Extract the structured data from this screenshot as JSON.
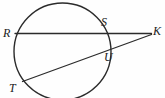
{
  "figure": {
    "kind": "geometry-diagram",
    "width": 165,
    "height": 98,
    "background_color": "#fefefe",
    "stroke_color": "#2b2b2b",
    "label_color": "#1b1b1b",
    "circle": {
      "name": "main-circle",
      "cx": 62.5,
      "cy": 51.5,
      "r": 48.5,
      "stroke_width": 1.4,
      "fill": "none"
    },
    "segments": [
      {
        "name": "secant-rk",
        "from": "R",
        "to": "K",
        "x1": 15,
        "y1": 33.5,
        "x2": 151.5,
        "y2": 33.5,
        "stroke_width": 1.3
      },
      {
        "name": "secant-tk",
        "from": "T",
        "to": "K",
        "x1": 22.5,
        "y1": 81.5,
        "x2": 151.5,
        "y2": 34.5,
        "stroke_width": 1.3
      }
    ],
    "points": [
      {
        "id": "R",
        "label": "R",
        "x": 15,
        "y": 33.5,
        "label_x": 3,
        "label_y": 27
      },
      {
        "id": "S",
        "label": "S",
        "x": 101,
        "y": 33.5,
        "label_x": 101,
        "label_y": 16
      },
      {
        "id": "K",
        "label": "K",
        "x": 151.5,
        "y": 33.5,
        "label_x": 153,
        "label_y": 25
      },
      {
        "id": "U",
        "label": "U",
        "x": 103,
        "y": 52,
        "label_x": 104,
        "label_y": 51
      },
      {
        "id": "T",
        "label": "T",
        "x": 22.5,
        "y": 81.5,
        "label_x": 9,
        "label_y": 82
      }
    ]
  },
  "chart_data": {
    "type": "diagram",
    "title": "",
    "labels": [
      "R",
      "S",
      "K",
      "U",
      "T"
    ],
    "shapes": [
      "circle",
      "line R to K",
      "line T to K"
    ]
  }
}
